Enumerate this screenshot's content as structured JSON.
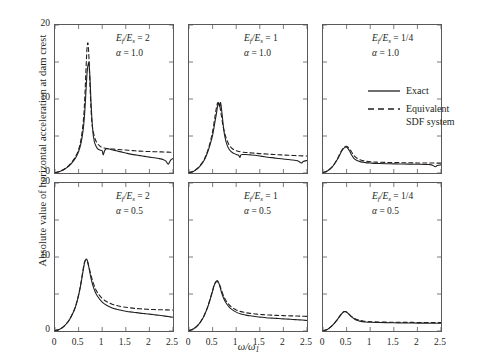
{
  "figure": {
    "ylabel": "Absolute value of horizontal acceleration at dam crest",
    "xlabel_main": "ω/ω",
    "xlabel_sub": "1"
  },
  "legend": {
    "position": "top-right-panel",
    "items": [
      {
        "label": "Exact",
        "style": "solid",
        "color": "#231f20"
      },
      {
        "label": "Equivalent\nSDF system",
        "style": "dashed",
        "color": "#231f20"
      }
    ]
  },
  "axes": {
    "y_ticks": [
      "0",
      "10",
      "20"
    ],
    "y_tick_values": [
      0,
      10,
      20
    ],
    "y_minor_values": [
      5,
      15
    ],
    "ylim": [
      0,
      20
    ],
    "x_ticks": [
      "0",
      "0.5",
      "1",
      "1.5",
      "2",
      "2.5"
    ],
    "x_tick_values": [
      0,
      0.5,
      1,
      1.5,
      2,
      2.5
    ],
    "xlim": [
      0,
      2.5
    ],
    "grid": false
  },
  "chart_data": [
    {
      "type": "line",
      "panel": "top-left",
      "title": "",
      "annotation_ratio": "Eƒ/Eₛ = 2",
      "annotation_alpha": "α = 1.0",
      "ratio_numer": "E",
      "ratio_value": "2",
      "alpha_value": "1.0",
      "xlabel": "ω/ω1",
      "ylabel": "Absolute value of horizontal acceleration at dam crest",
      "xlim": [
        0,
        2.5
      ],
      "ylim": [
        0,
        20
      ],
      "series": [
        {
          "name": "Exact",
          "style": "solid",
          "x": [
            0,
            0.1,
            0.2,
            0.3,
            0.4,
            0.45,
            0.5,
            0.55,
            0.6,
            0.63,
            0.66,
            0.68,
            0.7,
            0.72,
            0.74,
            0.76,
            0.78,
            0.8,
            0.82,
            0.85,
            0.9,
            0.95,
            1.0,
            1.02,
            1.05,
            1.08,
            1.1,
            1.15,
            1.2,
            1.3,
            1.4,
            1.5,
            1.6,
            1.7,
            1.8,
            1.9,
            2.0,
            2.1,
            2.2,
            2.3,
            2.35,
            2.4,
            2.45,
            2.5
          ],
          "y": [
            0.05,
            0.2,
            0.5,
            0.95,
            1.7,
            2.2,
            2.9,
            4.0,
            6.0,
            8.2,
            11.5,
            13.6,
            14.6,
            14.8,
            13.0,
            10.0,
            7.5,
            5.8,
            4.7,
            3.9,
            3.3,
            3.1,
            3.0,
            2.45,
            3.0,
            3.25,
            3.3,
            3.25,
            3.15,
            3.0,
            2.85,
            2.7,
            2.55,
            2.45,
            2.35,
            2.25,
            2.15,
            2.05,
            1.95,
            1.8,
            1.6,
            1.2,
            1.75,
            1.95
          ]
        },
        {
          "name": "Equivalent SDF system",
          "style": "dashed",
          "x": [
            0,
            0.1,
            0.2,
            0.3,
            0.4,
            0.45,
            0.5,
            0.55,
            0.6,
            0.63,
            0.66,
            0.68,
            0.7,
            0.72,
            0.74,
            0.76,
            0.78,
            0.8,
            0.85,
            0.9,
            0.95,
            1.0,
            1.1,
            1.2,
            1.3,
            1.4,
            1.5,
            1.6,
            1.7,
            1.8,
            1.9,
            2.0,
            2.1,
            2.2,
            2.3,
            2.4,
            2.5
          ],
          "y": [
            0.05,
            0.22,
            0.55,
            1.05,
            1.85,
            2.4,
            3.2,
            4.5,
            7.0,
            10.0,
            14.5,
            17.0,
            17.5,
            15.5,
            12.0,
            9.0,
            7.0,
            5.9,
            4.6,
            4.0,
            3.65,
            3.45,
            3.3,
            3.25,
            3.2,
            3.15,
            3.1,
            3.05,
            3.0,
            2.95,
            2.92,
            2.9,
            2.88,
            2.86,
            2.84,
            2.82,
            2.8
          ]
        }
      ]
    },
    {
      "type": "line",
      "panel": "top-middle",
      "annotation_ratio": "Eƒ/Eₛ = 1",
      "annotation_alpha": "α = 1.0",
      "ratio_value": "1",
      "alpha_value": "1.0",
      "xlim": [
        0,
        2.5
      ],
      "ylim": [
        0,
        20
      ],
      "series": [
        {
          "name": "Exact",
          "style": "solid",
          "x": [
            0,
            0.1,
            0.2,
            0.3,
            0.35,
            0.4,
            0.45,
            0.5,
            0.55,
            0.58,
            0.61,
            0.63,
            0.65,
            0.67,
            0.7,
            0.73,
            0.76,
            0.8,
            0.85,
            0.9,
            0.95,
            1.0,
            1.05,
            1.08,
            1.1,
            1.15,
            1.2,
            1.3,
            1.4,
            1.5,
            1.6,
            1.7,
            1.8,
            1.9,
            2.0,
            2.1,
            2.2,
            2.3,
            2.38,
            2.42,
            2.5
          ],
          "y": [
            0.05,
            0.25,
            0.7,
            1.5,
            2.1,
            2.9,
            3.9,
            5.1,
            6.9,
            8.0,
            9.2,
            9.4,
            9.0,
            9.5,
            8.0,
            6.2,
            4.9,
            3.9,
            3.2,
            2.85,
            2.65,
            2.5,
            2.4,
            2.1,
            2.45,
            2.5,
            2.5,
            2.45,
            2.4,
            2.3,
            2.2,
            2.1,
            2.05,
            1.95,
            1.9,
            1.82,
            1.75,
            1.65,
            1.35,
            1.55,
            1.7
          ]
        },
        {
          "name": "Equivalent SDF system",
          "style": "dashed",
          "x": [
            0,
            0.1,
            0.2,
            0.3,
            0.35,
            0.4,
            0.45,
            0.5,
            0.55,
            0.58,
            0.61,
            0.64,
            0.66,
            0.68,
            0.72,
            0.76,
            0.8,
            0.85,
            0.9,
            0.95,
            1.0,
            1.1,
            1.2,
            1.3,
            1.4,
            1.5,
            1.6,
            1.7,
            1.8,
            1.9,
            2.0,
            2.1,
            2.2,
            2.3,
            2.4,
            2.5
          ],
          "y": [
            0.05,
            0.27,
            0.75,
            1.6,
            2.25,
            3.1,
            4.2,
            5.6,
            7.6,
            8.8,
            9.5,
            9.3,
            8.8,
            8.0,
            6.4,
            5.3,
            4.5,
            3.8,
            3.4,
            3.15,
            3.0,
            2.85,
            2.78,
            2.72,
            2.68,
            2.62,
            2.58,
            2.54,
            2.5,
            2.46,
            2.43,
            2.4,
            2.37,
            2.34,
            2.32,
            2.3
          ]
        }
      ]
    },
    {
      "type": "line",
      "panel": "top-right",
      "annotation_ratio": "Eƒ/Eₛ = 1/4",
      "annotation_alpha": "α = 1.0",
      "ratio_value": "1/4",
      "alpha_value": "1.0",
      "xlim": [
        0,
        2.5
      ],
      "ylim": [
        0,
        20
      ],
      "series": [
        {
          "name": "Exact",
          "style": "solid",
          "x": [
            0,
            0.1,
            0.2,
            0.3,
            0.35,
            0.4,
            0.45,
            0.5,
            0.53,
            0.56,
            0.6,
            0.65,
            0.7,
            0.8,
            0.9,
            1.0,
            1.1,
            1.2,
            1.4,
            1.6,
            1.8,
            2.0,
            2.2,
            2.3,
            2.38,
            2.42,
            2.5
          ],
          "y": [
            0.05,
            0.3,
            0.85,
            1.8,
            2.4,
            3.0,
            3.4,
            3.5,
            3.3,
            3.0,
            2.5,
            2.0,
            1.75,
            1.5,
            1.4,
            1.35,
            1.3,
            1.28,
            1.25,
            1.22,
            1.2,
            1.18,
            1.15,
            1.1,
            0.85,
            1.0,
            1.1
          ]
        },
        {
          "name": "Equivalent SDF system",
          "style": "dashed",
          "x": [
            0,
            0.1,
            0.2,
            0.3,
            0.35,
            0.4,
            0.45,
            0.5,
            0.55,
            0.6,
            0.65,
            0.7,
            0.8,
            0.9,
            1.0,
            1.1,
            1.2,
            1.4,
            1.6,
            1.8,
            2.0,
            2.2,
            2.4,
            2.5
          ],
          "y": [
            0.05,
            0.3,
            0.88,
            1.85,
            2.5,
            3.1,
            3.5,
            3.6,
            3.35,
            2.9,
            2.4,
            2.1,
            1.75,
            1.6,
            1.52,
            1.48,
            1.45,
            1.42,
            1.4,
            1.38,
            1.36,
            1.35,
            1.34,
            1.33
          ]
        }
      ]
    },
    {
      "type": "line",
      "panel": "bottom-left",
      "annotation_ratio": "Eƒ/Eₛ = 2",
      "annotation_alpha": "α = 0.5",
      "ratio_value": "2",
      "alpha_value": "0.5",
      "xlim": [
        0,
        2.5
      ],
      "ylim": [
        0,
        20
      ],
      "series": [
        {
          "name": "Exact",
          "style": "solid",
          "x": [
            0,
            0.1,
            0.2,
            0.3,
            0.4,
            0.45,
            0.5,
            0.55,
            0.6,
            0.63,
            0.66,
            0.68,
            0.7,
            0.73,
            0.76,
            0.8,
            0.85,
            0.9,
            1.0,
            1.1,
            1.2,
            1.3,
            1.4,
            1.5,
            1.6,
            1.7,
            1.8,
            1.9,
            2.0,
            2.1,
            2.2,
            2.3,
            2.4,
            2.5
          ],
          "y": [
            0.05,
            0.25,
            0.7,
            1.45,
            2.7,
            3.6,
            4.8,
            6.4,
            8.3,
            9.3,
            9.7,
            9.6,
            9.2,
            8.2,
            7.2,
            6.2,
            5.3,
            4.7,
            3.9,
            3.45,
            3.15,
            2.95,
            2.8,
            2.68,
            2.58,
            2.5,
            2.42,
            2.35,
            2.28,
            2.2,
            2.12,
            2.05,
            1.95,
            1.85
          ]
        },
        {
          "name": "Equivalent SDF system",
          "style": "dashed",
          "x": [
            0,
            0.1,
            0.2,
            0.3,
            0.4,
            0.45,
            0.5,
            0.55,
            0.6,
            0.63,
            0.66,
            0.69,
            0.72,
            0.76,
            0.8,
            0.85,
            0.9,
            1.0,
            1.1,
            1.2,
            1.3,
            1.4,
            1.5,
            1.6,
            1.7,
            1.8,
            1.9,
            2.0,
            2.1,
            2.2,
            2.3,
            2.4,
            2.5
          ],
          "y": [
            0.05,
            0.25,
            0.7,
            1.5,
            2.75,
            3.65,
            4.9,
            6.5,
            8.5,
            9.4,
            9.6,
            9.3,
            8.6,
            7.6,
            6.7,
            5.8,
            5.2,
            4.4,
            3.95,
            3.65,
            3.45,
            3.3,
            3.2,
            3.12,
            3.05,
            3.0,
            2.96,
            2.92,
            2.9,
            2.88,
            2.86,
            2.85,
            2.84
          ]
        }
      ]
    },
    {
      "type": "line",
      "panel": "bottom-middle",
      "annotation_ratio": "Eƒ/Eₛ = 1",
      "annotation_alpha": "α = 0.5",
      "ratio_value": "1",
      "alpha_value": "0.5",
      "xlim": [
        0,
        2.5
      ],
      "ylim": [
        0,
        20
      ],
      "series": [
        {
          "name": "Exact",
          "style": "solid",
          "x": [
            0,
            0.1,
            0.2,
            0.3,
            0.35,
            0.4,
            0.45,
            0.5,
            0.53,
            0.56,
            0.59,
            0.61,
            0.63,
            0.66,
            0.7,
            0.75,
            0.8,
            0.85,
            0.9,
            1.0,
            1.1,
            1.2,
            1.3,
            1.4,
            1.5,
            1.6,
            1.7,
            1.8,
            1.9,
            2.0,
            2.1,
            2.2,
            2.3,
            2.4,
            2.5
          ],
          "y": [
            0.05,
            0.3,
            0.85,
            1.8,
            2.5,
            3.3,
            4.3,
            5.4,
            6.1,
            6.6,
            6.8,
            6.75,
            6.5,
            5.9,
            5.0,
            4.2,
            3.65,
            3.25,
            2.95,
            2.55,
            2.3,
            2.15,
            2.05,
            1.95,
            1.88,
            1.82,
            1.76,
            1.72,
            1.68,
            1.64,
            1.6,
            1.56,
            1.52,
            1.48,
            1.42
          ]
        },
        {
          "name": "Equivalent SDF system",
          "style": "dashed",
          "x": [
            0,
            0.1,
            0.2,
            0.3,
            0.35,
            0.4,
            0.45,
            0.5,
            0.53,
            0.57,
            0.6,
            0.63,
            0.66,
            0.7,
            0.75,
            0.8,
            0.85,
            0.9,
            1.0,
            1.1,
            1.2,
            1.3,
            1.4,
            1.5,
            1.6,
            1.7,
            1.8,
            1.9,
            2.0,
            2.1,
            2.2,
            2.3,
            2.4,
            2.5
          ],
          "y": [
            0.05,
            0.3,
            0.85,
            1.82,
            2.52,
            3.35,
            4.4,
            5.5,
            6.15,
            6.6,
            6.65,
            6.45,
            6.05,
            5.3,
            4.5,
            3.95,
            3.55,
            3.25,
            2.85,
            2.62,
            2.48,
            2.38,
            2.3,
            2.24,
            2.2,
            2.16,
            2.13,
            2.1,
            2.08,
            2.06,
            2.04,
            2.02,
            2.0,
            1.98
          ]
        }
      ]
    },
    {
      "type": "line",
      "panel": "bottom-right",
      "annotation_ratio": "Eƒ/Eₛ = 1/4",
      "annotation_alpha": "α = 0.5",
      "ratio_value": "1/4",
      "alpha_value": "0.5",
      "xlim": [
        0,
        2.5
      ],
      "ylim": [
        0,
        20
      ],
      "series": [
        {
          "name": "Exact",
          "style": "solid",
          "x": [
            0,
            0.1,
            0.2,
            0.3,
            0.35,
            0.4,
            0.44,
            0.48,
            0.52,
            0.56,
            0.6,
            0.65,
            0.7,
            0.8,
            0.9,
            1.0,
            1.2,
            1.4,
            1.6,
            1.8,
            2.0,
            2.2,
            2.4,
            2.5
          ],
          "y": [
            0.03,
            0.25,
            0.75,
            1.5,
            1.95,
            2.35,
            2.6,
            2.62,
            2.45,
            2.2,
            1.95,
            1.7,
            1.5,
            1.3,
            1.22,
            1.18,
            1.14,
            1.12,
            1.1,
            1.08,
            1.07,
            1.06,
            1.05,
            1.04
          ]
        },
        {
          "name": "Equivalent SDF system",
          "style": "dashed",
          "x": [
            0,
            0.1,
            0.2,
            0.3,
            0.35,
            0.4,
            0.45,
            0.49,
            0.53,
            0.57,
            0.62,
            0.68,
            0.75,
            0.85,
            0.95,
            1.1,
            1.3,
            1.5,
            1.7,
            1.9,
            2.1,
            2.3,
            2.5
          ],
          "y": [
            0.03,
            0.25,
            0.76,
            1.52,
            1.98,
            2.4,
            2.62,
            2.6,
            2.4,
            2.15,
            1.9,
            1.67,
            1.5,
            1.35,
            1.28,
            1.23,
            1.2,
            1.18,
            1.17,
            1.16,
            1.15,
            1.14,
            1.13
          ]
        }
      ]
    }
  ]
}
